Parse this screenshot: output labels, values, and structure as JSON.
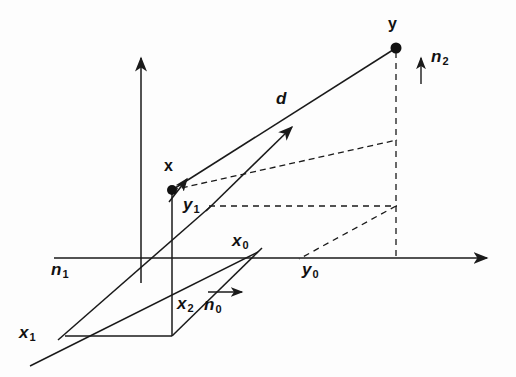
{
  "figure": {
    "background_color": "#fdfdfd",
    "stroke_color": "#1a1a1a"
  },
  "labels": {
    "point_x": "x",
    "point_y": "y",
    "distance": "d",
    "normal_0": "n",
    "normal_0_sub": "0",
    "normal_1": "n",
    "normal_1_sub": "1",
    "normal_2": "n",
    "normal_2_sub": "2",
    "coord_x0": "x",
    "coord_x0_sub": "0",
    "coord_x1": "x",
    "coord_x1_sub": "1",
    "coord_x2": "x",
    "coord_x2_sub": "2",
    "coord_y0": "y",
    "coord_y0_sub": "0",
    "coord_y1": "y",
    "coord_y1_sub": "1"
  },
  "geometry": {
    "points": {
      "x": {
        "px": 172,
        "py": 190
      },
      "y": {
        "px": 396,
        "py": 48
      },
      "origin": {
        "px": 141,
        "py": 258
      },
      "x0_on_axis": {
        "px": 247,
        "py": 258
      },
      "y0_on_axis": {
        "px": 300,
        "py": 258
      }
    },
    "axes": {
      "horizontal": {
        "x1": 54,
        "y1": 258,
        "x2": 489,
        "y2": 258,
        "arrow": "right"
      },
      "vertical": {
        "x1": 141,
        "y1": 283,
        "x2": 141,
        "y2": 56,
        "arrow": "up"
      },
      "depth": {
        "x1": 12,
        "y1": 357,
        "x2": 247,
        "y2": 258,
        "arrow": "none"
      }
    },
    "vectors": {
      "d": {
        "x1": 172,
        "y1": 190,
        "x2": 396,
        "y2": 48,
        "style": "solid",
        "label": "d"
      },
      "d_projection": {
        "x1": 172,
        "y1": 190,
        "x2": 396,
        "y2": 140,
        "style": "dashed"
      },
      "inner_arrow": {
        "x1": 210,
        "y1": 207,
        "x2": 290,
        "y2": 129,
        "style": "solid",
        "arrow": "end"
      },
      "x_tick_arrow": {
        "x1": 170,
        "y1": 199,
        "x2": 186,
        "y2": 180,
        "style": "solid",
        "arrow": "end"
      },
      "n0": {
        "x1": 208,
        "y1": 292,
        "x2": 245,
        "y2": 292,
        "arrow": "right"
      },
      "n2": {
        "x1": 422,
        "y1": 84,
        "x2": 422,
        "y2": 57,
        "arrow": "up"
      }
    },
    "dashed_paths": [
      {
        "name": "y-vertical-drop",
        "from": {
          "x": 396,
          "y": 48
        },
        "to": {
          "x": 396,
          "y": 258
        }
      },
      {
        "name": "y1-horizontal",
        "from": {
          "x": 210,
          "y": 206
        },
        "to": {
          "x": 396,
          "y": 206
        }
      },
      {
        "name": "y0-diagonal",
        "from": {
          "x": 396,
          "y": 206
        },
        "to": {
          "x": 300,
          "y": 258
        }
      }
    ],
    "base_parallelogram": [
      {
        "x": 65,
        "y": 336
      },
      {
        "x": 172,
        "y": 336
      },
      {
        "x": 247,
        "y": 258
      },
      {
        "x": 141,
        "y": 258
      }
    ],
    "vertical_x2": {
      "x1": 172,
      "y1": 190,
      "x2": 172,
      "y2": 336
    },
    "depth_line_lower": {
      "x1": 30,
      "y1": 366,
      "x2": 247,
      "y2": 258
    },
    "depth_line_upper": {
      "x1": 55,
      "y1": 312,
      "x2": 200,
      "y2": 160
    }
  },
  "label_positions": {
    "point_x": {
      "left": 163,
      "top": 160
    },
    "point_y": {
      "left": 388,
      "top": 18
    },
    "distance": {
      "left": 276,
      "top": 91
    },
    "normal_0": {
      "left": 205,
      "top": 297
    },
    "normal_1": {
      "left": 52,
      "top": 262
    },
    "normal_2": {
      "left": 432,
      "top": 48
    },
    "coord_x0": {
      "left": 233,
      "top": 233
    },
    "coord_x1": {
      "left": 20,
      "top": 325
    },
    "coord_x2": {
      "left": 178,
      "top": 296
    },
    "coord_y0": {
      "left": 303,
      "top": 262
    },
    "coord_y1": {
      "left": 184,
      "top": 197
    }
  }
}
